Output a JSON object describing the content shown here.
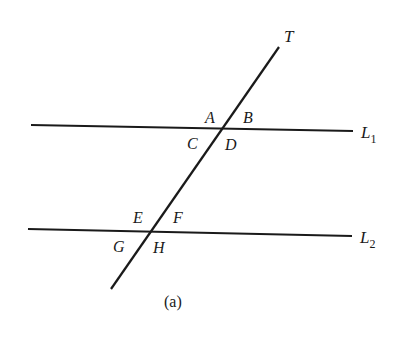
{
  "diagram": {
    "caption": "(a)",
    "lines": {
      "transversal": {
        "label": "T",
        "x1": 279,
        "y1": 47,
        "x2": 111,
        "y2": 289
      },
      "L1": {
        "label": "L",
        "sub": "1",
        "x1": 31,
        "y1": 125,
        "x2": 353,
        "y2": 131
      },
      "L2": {
        "label": "L",
        "sub": "2",
        "x1": 28,
        "y1": 229,
        "x2": 352,
        "y2": 236
      }
    },
    "angle_labels": {
      "A": "A",
      "B": "B",
      "C": "C",
      "D": "D",
      "E": "E",
      "F": "F",
      "G": "G",
      "H": "H"
    }
  }
}
